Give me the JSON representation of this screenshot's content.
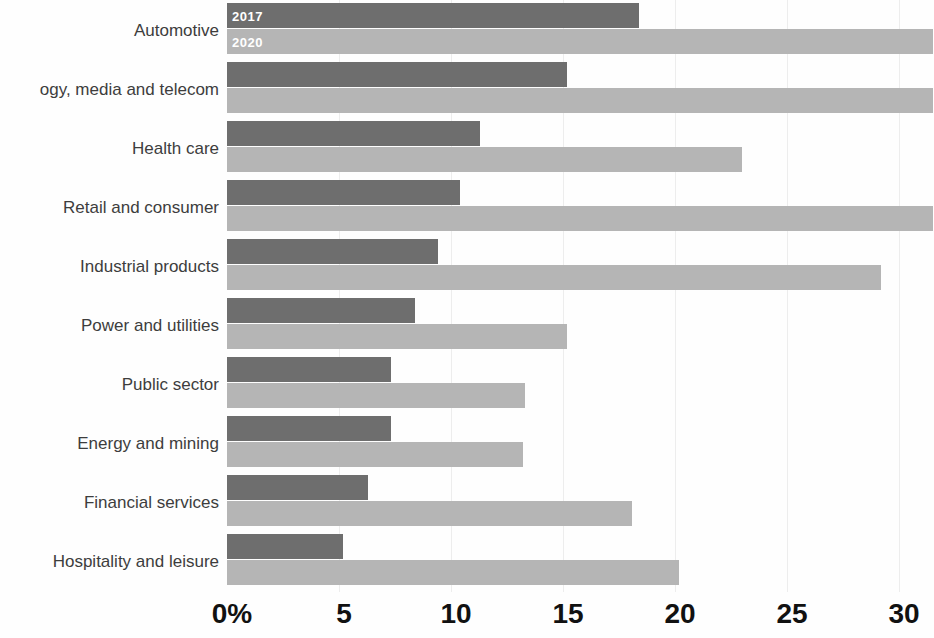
{
  "chart": {
    "type": "bar",
    "orientation": "horizontal",
    "title": "",
    "xlabel": "",
    "ylabel": ""
  },
  "colors": {
    "series_2017": "#6e6e6e",
    "series_2020": "#b5b5b5",
    "gridline": "#ededed",
    "category_label": "#3d3d3d",
    "tick_label": "#111111",
    "background": "#fefefe"
  },
  "legend": {
    "position": "inside-first-bars",
    "entries": [
      {
        "label": "2017",
        "color": "#6e6e6e"
      },
      {
        "label": "2020",
        "color": "#b5b5b5"
      }
    ]
  },
  "axis": {
    "x": {
      "ticks": [
        "0%",
        "5",
        "10",
        "15",
        "20",
        "25",
        "30"
      ],
      "values": [
        0,
        5,
        10,
        15,
        20,
        25,
        30
      ],
      "min": 0,
      "max": 31.5,
      "grid": true
    }
  },
  "chart_data": {
    "type": "bar",
    "title": "",
    "xlabel": "",
    "ylabel": "",
    "xlim": [
      0,
      31.5
    ],
    "grid": true,
    "legend_position": "inside-first-bars",
    "categories": [
      "Automotive",
      "Technology, media and telecom",
      "Health care",
      "Retail and consumer",
      "Industrial products",
      "Power and utilities",
      "Public sector",
      "Energy and mining",
      "Financial services",
      "Hospitality and leisure"
    ],
    "tick_labels": [
      "0%",
      "5",
      "10",
      "15",
      "20",
      "25",
      "30"
    ],
    "series": [
      {
        "name": "2017",
        "color": "#6e6e6e",
        "values": [
          18.4,
          15.2,
          11.3,
          10.4,
          9.4,
          8.4,
          7.3,
          7.3,
          6.3,
          5.2
        ]
      },
      {
        "name": "2020",
        "color": "#b5b5b5",
        "values": [
          31.5,
          31.5,
          23.0,
          31.5,
          29.2,
          15.2,
          13.3,
          13.2,
          18.1,
          20.2
        ]
      }
    ]
  },
  "rows": [
    {
      "label": "Automotive",
      "v2017": 18.4,
      "v2020": 31.5,
      "top": 3
    },
    {
      "label": "ogy, media and telecom",
      "v2017": 15.2,
      "v2020": 31.5,
      "top": 62
    },
    {
      "label": "Health care",
      "v2017": 11.3,
      "v2020": 23.0,
      "top": 121
    },
    {
      "label": "Retail and consumer",
      "v2017": 10.4,
      "v2020": 31.5,
      "top": 180
    },
    {
      "label": "Industrial products",
      "v2017": 9.4,
      "v2020": 29.2,
      "top": 239
    },
    {
      "label": "Power and utilities",
      "v2017": 8.4,
      "v2020": 15.2,
      "top": 298
    },
    {
      "label": "Public sector",
      "v2017": 7.3,
      "v2020": 13.3,
      "top": 357
    },
    {
      "label": "Energy and mining",
      "v2017": 7.3,
      "v2020": 13.2,
      "top": 416
    },
    {
      "label": "Financial services",
      "v2017": 6.3,
      "v2020": 18.1,
      "top": 475
    },
    {
      "label": "Hospitality and leisure",
      "v2017": 5.2,
      "v2020": 20.2,
      "top": 534
    }
  ]
}
